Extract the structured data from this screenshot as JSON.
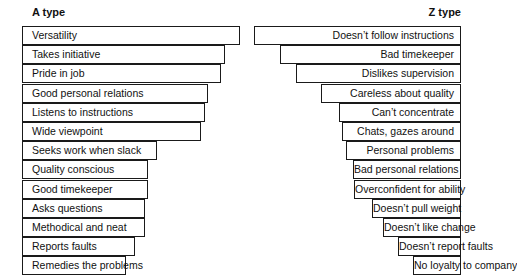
{
  "a_column": {
    "title": "A type",
    "items": [
      {
        "label": "Versatility",
        "right": 240
      },
      {
        "label": "Takes initiative",
        "right": 225
      },
      {
        "label": "Pride in job",
        "right": 221
      },
      {
        "label": "Good personal relations",
        "right": 208
      },
      {
        "label": "Listens to instructions",
        "right": 205
      },
      {
        "label": "Wide viewpoint",
        "right": 201
      },
      {
        "label": "Seeks work when slack",
        "right": 157
      },
      {
        "label": "Quality conscious",
        "right": 148
      },
      {
        "label": "Good timekeeper",
        "right": 148
      },
      {
        "label": "Asks questions",
        "right": 145
      },
      {
        "label": "Methodical and neat",
        "right": 145
      },
      {
        "label": "Reports faults",
        "right": 135
      },
      {
        "label": "Remedies the problems",
        "right": 126
      }
    ]
  },
  "z_column": {
    "title": "Z type",
    "items": [
      {
        "label": "Doesn’t follow instructions",
        "left": 254
      },
      {
        "label": "Bad timekeeper",
        "left": 280
      },
      {
        "label": "Dislikes supervision",
        "left": 296
      },
      {
        "label": "Careless about quality",
        "left": 321
      },
      {
        "label": "Can’t concentrate",
        "left": 339
      },
      {
        "label": "Chats, gazes around",
        "left": 342
      },
      {
        "label": "Personal problems",
        "left": 346
      },
      {
        "label": "Bad personal relations",
        "left": 353
      },
      {
        "label": "Overconfident for ability",
        "left": 354
      },
      {
        "label": "Doesn’t pull weight",
        "left": 372
      },
      {
        "label": "Doesn’t like change",
        "left": 383
      },
      {
        "label": "Doesn’t report faults",
        "left": 398
      },
      {
        "label": "No loyalty to company",
        "left": 413
      }
    ]
  }
}
